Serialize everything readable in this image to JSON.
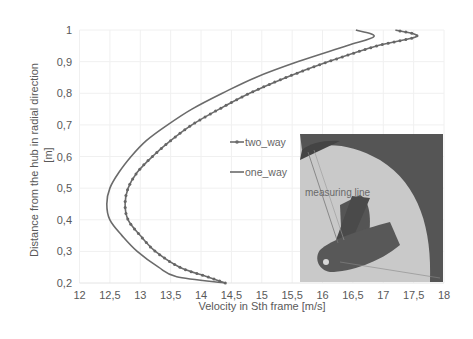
{
  "chart_data": {
    "type": "line",
    "title": "",
    "xlabel": "Velocity in Sth frame [m/s]",
    "ylabel": "Distance from the hub in radial direction [m]",
    "xlim": [
      12,
      18
    ],
    "ylim": [
      0.2,
      1.0
    ],
    "x_ticks": [
      "12",
      "12,5",
      "13",
      "13,5",
      "14",
      "14,5",
      "15",
      "15,5",
      "16",
      "16,5",
      "17",
      "17,5",
      "18"
    ],
    "y_ticks": [
      "0,2",
      "0,3",
      "0,4",
      "0,5",
      "0,6",
      "0,7",
      "0,8",
      "0,9",
      "1"
    ],
    "grid": true,
    "legend_position": "center-right",
    "series": [
      {
        "name": "two_way",
        "marker": "dot",
        "color": "#6b6b6b",
        "r": [
          0.2,
          0.22,
          0.25,
          0.3,
          0.35,
          0.4,
          0.45,
          0.5,
          0.55,
          0.6,
          0.65,
          0.7,
          0.75,
          0.8,
          0.85,
          0.9,
          0.95,
          0.98,
          1.0
        ],
        "v": [
          14.4,
          14.1,
          13.65,
          13.25,
          13.0,
          12.8,
          12.75,
          12.8,
          12.95,
          13.2,
          13.5,
          13.85,
          14.3,
          14.8,
          15.4,
          16.1,
          16.9,
          17.55,
          17.2
        ]
      },
      {
        "name": "one_way",
        "marker": "none",
        "color": "#6b6b6b",
        "r": [
          0.2,
          0.22,
          0.25,
          0.3,
          0.35,
          0.4,
          0.45,
          0.5,
          0.55,
          0.6,
          0.65,
          0.7,
          0.75,
          0.8,
          0.85,
          0.9,
          0.95,
          0.98,
          1.0
        ],
        "v": [
          14.4,
          13.6,
          13.3,
          12.95,
          12.7,
          12.5,
          12.45,
          12.5,
          12.65,
          12.85,
          13.1,
          13.45,
          13.85,
          14.35,
          14.9,
          15.6,
          16.4,
          16.85,
          16.55
        ]
      }
    ],
    "annotations": [
      "measuring line"
    ]
  },
  "legend": {
    "two_way": "two_way",
    "one_way": "one_way"
  },
  "inset": {
    "label": "measuring line"
  },
  "axes": {
    "xlabel": "Velocity in Sth frame [m/s]",
    "ylabel_line1": "Distance from the hub in radial direction",
    "ylabel_line2": "[m]"
  }
}
